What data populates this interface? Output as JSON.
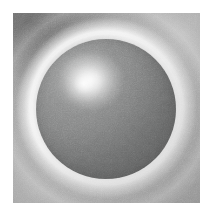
{
  "figure": {
    "title": "Grayscale micrograph of a spherical particle",
    "border_color": "#ffffff",
    "border_width_px": 13,
    "plate": {
      "x": 13,
      "y": 13,
      "width": 187,
      "height": 190,
      "background_color": "#a2a2a2",
      "texture": "fine-grain-noise"
    },
    "colors": {
      "white": "#ffffff",
      "halo_bright": "#f5f5f5",
      "background_gray": "#a2a2a2",
      "sphere_mid_gray": "#8d8e8e",
      "sphere_dark_gray": "#6d6e6e",
      "corner_dark_gray": "#6e6e6e"
    },
    "subject": {
      "label": "sphere",
      "center_x": 107,
      "center_y": 109,
      "radius_px": 69,
      "surface_tone": "#8d8e8e",
      "specular_highlight": {
        "label": "specular-highlight",
        "center_x": 89,
        "center_y": 86,
        "radius_px": 26,
        "peak_tone": "#fdfdfd"
      },
      "halo": {
        "label": "bright-halo-ring",
        "inner_radius_px": 70,
        "outer_radius_px": 86,
        "tone": "#f5f5f5",
        "brightest_sector": "upper-left"
      },
      "secondary_arc": {
        "label": "secondary-diffraction-arc",
        "radius_px": 100,
        "tone": "#e8e8e8"
      }
    },
    "background_features": [
      {
        "label": "dark-corner-gradient",
        "position": "top-left",
        "tone": "#6e6e6e"
      },
      {
        "label": "light-wash",
        "position": "top-right",
        "tone": "#b9b9b9"
      },
      {
        "label": "light-wash",
        "position": "bottom-left",
        "tone": "#b4b4b4"
      }
    ]
  }
}
